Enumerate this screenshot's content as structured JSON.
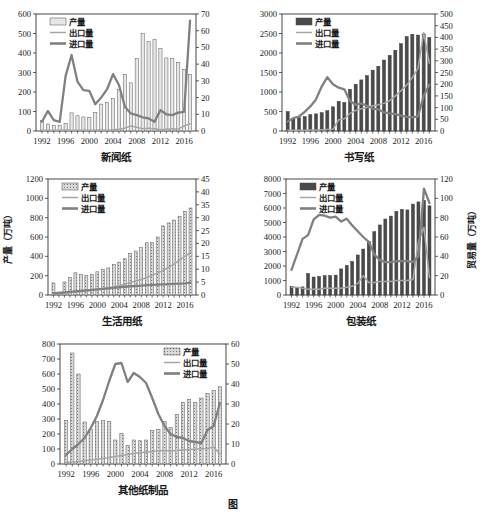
{
  "figure": {
    "panel_count": 5,
    "colors": {
      "bar_fill": "#d9d9d9",
      "bar_edge": "#4d4d4d",
      "export_line": "#a6a6a6",
      "import_line": "#808080",
      "axis": "#333333",
      "text": "#1a1a1a"
    },
    "legend_labels": {
      "production": "产量",
      "export": "出口量",
      "import": "进口量"
    }
  },
  "chart_data": [
    {
      "type": "bar",
      "id": "newsprint",
      "title": "新闻纸",
      "xlabel": "",
      "ylabel": "",
      "y2label": "",
      "xticks": [
        1992,
        1996,
        2000,
        2004,
        2008,
        2012,
        2016
      ],
      "xlim": [
        1991,
        2018
      ],
      "ylim": [
        0,
        600
      ],
      "yticks": [
        0,
        100,
        200,
        300,
        400,
        500,
        600
      ],
      "y2lim": [
        0,
        70
      ],
      "y2ticks": [
        0,
        10,
        20,
        30,
        40,
        50,
        60,
        70
      ],
      "grid": false,
      "legend_position": "top-left",
      "x": [
        1992,
        1993,
        1994,
        1995,
        1996,
        1997,
        1998,
        1999,
        2000,
        2001,
        2002,
        2003,
        2004,
        2005,
        2006,
        2007,
        2008,
        2009,
        2010,
        2011,
        2012,
        2013,
        2014,
        2015,
        2016,
        2017
      ],
      "series": [
        {
          "name": "产量",
          "axis": "left",
          "kind": "bar",
          "values": [
            55,
            36,
            28,
            30,
            38,
            93,
            78,
            72,
            68,
            95,
            138,
            146,
            166,
            213,
            290,
            247,
            372,
            499,
            458,
            471,
            422,
            375,
            371,
            352,
            316,
            290
          ]
        },
        {
          "name": "出口量",
          "axis": "right",
          "kind": "line",
          "values": [
            0.5,
            0.4,
            0.4,
            0.4,
            0.6,
            0.5,
            0.5,
            0.5,
            0.4,
            0.5,
            0.6,
            0.5,
            0.8,
            1.0,
            1.7,
            3.0,
            2.3,
            1.4,
            1.6,
            1.3,
            0.8,
            1.1,
            1.3,
            1.1,
            3.0,
            4.3
          ]
        },
        {
          "name": "进口量",
          "axis": "right",
          "kind": "line",
          "values": [
            5.5,
            12.0,
            6.5,
            5.5,
            33.0,
            45.5,
            29.5,
            24.5,
            24.0,
            16.0,
            20.0,
            25.0,
            34.0,
            27.5,
            14.5,
            10.5,
            9.5,
            8.2,
            7.5,
            5.5,
            12.5,
            10.0,
            9.5,
            11.0,
            11.5,
            66.0
          ]
        }
      ]
    },
    {
      "type": "bar",
      "id": "writing-paper",
      "title": "书写纸",
      "xlabel": "",
      "ylabel": "",
      "y2label": "",
      "xticks": [
        1992,
        1996,
        2000,
        2004,
        2008,
        2012,
        2016
      ],
      "xlim": [
        1991,
        2018
      ],
      "ylim": [
        0,
        3000
      ],
      "yticks": [
        0,
        500,
        1000,
        1500,
        2000,
        2500,
        3000
      ],
      "y2lim": [
        0,
        500
      ],
      "y2ticks": [
        0,
        50,
        100,
        150,
        200,
        250,
        300,
        350,
        400,
        450,
        500
      ],
      "grid": false,
      "legend_position": "top-left",
      "x": [
        1992,
        1993,
        1994,
        1995,
        1996,
        1997,
        1998,
        1999,
        2000,
        2001,
        2002,
        2003,
        2004,
        2005,
        2006,
        2007,
        2008,
        2009,
        2010,
        2011,
        2012,
        2013,
        2014,
        2015,
        2016,
        2017
      ],
      "series": [
        {
          "name": "产量",
          "axis": "left",
          "kind": "bar",
          "values": [
            500,
            310,
            340,
            370,
            420,
            440,
            470,
            520,
            620,
            760,
            730,
            1070,
            1200,
            1310,
            1420,
            1560,
            1660,
            1820,
            1940,
            2070,
            2240,
            2420,
            2480,
            2460,
            2490,
            2400
          ]
        },
        {
          "name": "出口量",
          "axis": "right",
          "kind": "line",
          "values": [
            3,
            3,
            3,
            3,
            4,
            4,
            5,
            6,
            7,
            48,
            52,
            75,
            88,
            95,
            100,
            108,
            112,
            118,
            130,
            150,
            172,
            196,
            228,
            268,
            420,
            290
          ]
        },
        {
          "name": "进口量",
          "axis": "right",
          "kind": "line",
          "values": [
            40,
            55,
            62,
            82,
            105,
            135,
            190,
            230,
            200,
            185,
            178,
            128,
            112,
            118,
            108,
            96,
            92,
            80,
            75,
            72,
            66,
            60,
            58,
            62,
            150,
            198
          ]
        }
      ]
    },
    {
      "type": "bar",
      "id": "tissue-paper",
      "title": "生活用纸",
      "xlabel": "",
      "ylabel": "产量（万吨）",
      "y2label": "",
      "xticks": [
        1992,
        1996,
        2000,
        2004,
        2008,
        2012,
        2016
      ],
      "xlim": [
        1991,
        2018
      ],
      "ylim": [
        0,
        1200
      ],
      "yticks": [
        0,
        200,
        400,
        600,
        800,
        1000,
        1200
      ],
      "y2lim": [
        0,
        45
      ],
      "y2ticks": [
        0,
        5,
        10,
        15,
        20,
        25,
        30,
        35,
        40,
        45
      ],
      "grid": false,
      "legend_position": "top-left",
      "x": [
        1992,
        1993,
        1994,
        1995,
        1996,
        1997,
        1998,
        1999,
        2000,
        2001,
        2002,
        2003,
        2004,
        2005,
        2006,
        2007,
        2008,
        2009,
        2010,
        2011,
        2012,
        2013,
        2014,
        2015,
        2016,
        2017
      ],
      "series": [
        {
          "name": "产量",
          "axis": "left",
          "kind": "bar",
          "values": [
            125,
            30,
            135,
            180,
            230,
            215,
            205,
            210,
            240,
            265,
            280,
            315,
            340,
            375,
            430,
            455,
            490,
            540,
            545,
            600,
            715,
            745,
            775,
            810,
            865,
            900
          ]
        },
        {
          "name": "出口量",
          "axis": "right",
          "kind": "line",
          "values": [
            0.5,
            0.6,
            0.8,
            1.0,
            1.2,
            1.4,
            1.6,
            1.8,
            2.1,
            2.4,
            2.8,
            3.2,
            3.6,
            4.2,
            4.8,
            5.4,
            6.0,
            6.8,
            7.6,
            8.6,
            9.5,
            10.8,
            12.0,
            13.5,
            15.0,
            16.5
          ]
        },
        {
          "name": "进口量",
          "axis": "right",
          "kind": "line",
          "values": [
            0.6,
            0.8,
            1.0,
            1.2,
            1.4,
            1.6,
            1.8,
            2.0,
            2.2,
            2.4,
            2.6,
            2.8,
            3.0,
            3.2,
            3.4,
            3.5,
            3.6,
            3.8,
            3.9,
            4.0,
            4.1,
            4.2,
            4.3,
            4.4,
            4.5,
            4.8
          ]
        }
      ]
    },
    {
      "type": "bar",
      "id": "packaging-paper",
      "title": "包装纸",
      "xlabel": "",
      "ylabel": "",
      "y2label": "贸易量（万吨）",
      "xticks": [
        1992,
        1996,
        2000,
        2004,
        2008,
        2012,
        2016
      ],
      "xlim": [
        1991,
        2018
      ],
      "ylim": [
        0,
        8000
      ],
      "yticks": [
        0,
        1000,
        2000,
        3000,
        4000,
        5000,
        6000,
        7000,
        8000
      ],
      "y2lim": [
        0,
        120
      ],
      "y2ticks": [
        0,
        20,
        40,
        60,
        80,
        100,
        120
      ],
      "grid": false,
      "legend_position": "top-left",
      "x": [
        1992,
        1993,
        1994,
        1995,
        1996,
        1997,
        1998,
        1999,
        2000,
        2001,
        2002,
        2003,
        2004,
        2005,
        2006,
        2007,
        2008,
        2009,
        2010,
        2011,
        2012,
        2013,
        2014,
        2015,
        2016,
        2017
      ],
      "series": [
        {
          "name": "产量",
          "axis": "left",
          "kind": "bar",
          "values": [
            600,
            530,
            560,
            1480,
            1240,
            1280,
            1330,
            1340,
            1370,
            1800,
            2040,
            2320,
            2760,
            3170,
            3700,
            4370,
            4830,
            5240,
            5440,
            5770,
            5900,
            5870,
            6270,
            6420,
            6530,
            6150
          ]
        },
        {
          "name": "出口量",
          "axis": "right",
          "kind": "line",
          "values": [
            8,
            8,
            7,
            6,
            6,
            6,
            7,
            7,
            7,
            7,
            8,
            9,
            12,
            20,
            13,
            13,
            14,
            14,
            14,
            15,
            15,
            15,
            16,
            55,
            70,
            18
          ]
        },
        {
          "name": "进口量",
          "axis": "right",
          "kind": "line",
          "values": [
            26,
            42,
            58,
            62,
            78,
            83,
            82,
            80,
            81,
            76,
            79,
            72,
            66,
            60,
            55,
            42,
            36,
            34,
            34,
            35,
            35,
            35,
            34,
            40,
            110,
            95
          ]
        }
      ]
    },
    {
      "type": "bar",
      "id": "other-paper-products",
      "title": "其他纸制品",
      "xlabel": "",
      "ylabel": "",
      "y2label": "",
      "xticks": [
        1992,
        1996,
        2000,
        2004,
        2008,
        2012,
        2016
      ],
      "xlim": [
        1991,
        2018
      ],
      "ylim": [
        0,
        800
      ],
      "yticks": [
        0,
        100,
        200,
        300,
        400,
        500,
        600,
        700,
        800
      ],
      "y2lim": [
        0,
        60
      ],
      "y2ticks": [
        0,
        10,
        20,
        30,
        40,
        50,
        60
      ],
      "grid": false,
      "legend_position": "top-right",
      "x": [
        1992,
        1993,
        1994,
        1995,
        1996,
        1997,
        1998,
        1999,
        2000,
        2001,
        2002,
        2003,
        2004,
        2005,
        2006,
        2007,
        2008,
        2009,
        2010,
        2011,
        2012,
        2013,
        2014,
        2015,
        2016,
        2017
      ],
      "series": [
        {
          "name": "产量",
          "axis": "left",
          "kind": "bar",
          "values": [
            290,
            740,
            600,
            280,
            230,
            285,
            290,
            285,
            160,
            205,
            125,
            160,
            155,
            160,
            225,
            230,
            285,
            245,
            330,
            410,
            430,
            410,
            440,
            470,
            490,
            515
          ]
        },
        {
          "name": "出口量",
          "axis": "right",
          "kind": "line",
          "values": [
            0.8,
            1.0,
            1.3,
            1.6,
            2.0,
            2.4,
            2.8,
            3.2,
            3.8,
            4.3,
            4.8,
            5.2,
            5.6,
            6.0,
            6.3,
            6.6,
            6.8,
            6.5,
            6.8,
            7.0,
            7.2,
            7.4,
            7.6,
            7.8,
            8.5,
            5.0
          ]
        },
        {
          "name": "进口量",
          "axis": "right",
          "kind": "line",
          "values": [
            4.5,
            7.5,
            10.0,
            13.0,
            18.0,
            24.0,
            32.0,
            41.5,
            50.0,
            50.5,
            41.0,
            45.5,
            43.5,
            40.5,
            33.0,
            25.0,
            19.0,
            15.0,
            13.5,
            13.0,
            11.5,
            11.0,
            10.5,
            17.0,
            19.0,
            30.5
          ]
        }
      ]
    }
  ],
  "caption": {
    "figure_number": "图"
  }
}
